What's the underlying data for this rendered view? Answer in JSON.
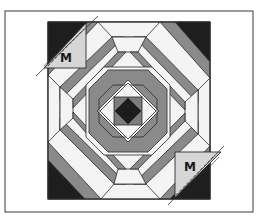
{
  "figure": {
    "frame": {
      "x": 5,
      "y": 11,
      "width": 248,
      "height": 201
    },
    "block": {
      "x": 48,
      "y": 22,
      "width": 162,
      "height": 177,
      "center": [
        128,
        111
      ]
    },
    "colors": {
      "background": "#ffffff",
      "light_log": "#f4f4f4",
      "medium_log": "#8a8a8a",
      "dark_corner": "#1e1e1e",
      "center_square": "#7c7c7c",
      "center_diamond": "#1c1c1c",
      "marker_triangle": "#d6d6d6",
      "outline": "#2a2a2a"
    },
    "markers": [
      {
        "id": "top-left",
        "label": "M"
      },
      {
        "id": "bottom-right",
        "label": "M"
      }
    ],
    "rings": 4
  }
}
